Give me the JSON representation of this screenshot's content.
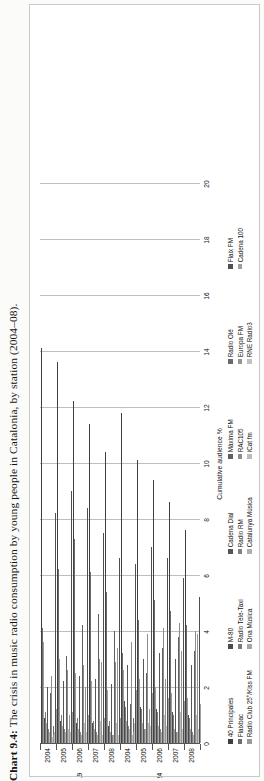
{
  "caption": {
    "number": "Chart 9.4:",
    "text": "The crisis in music radio consumption by young people in Catalonia, by station (2004–08)."
  },
  "chart_data": {
    "type": "bar",
    "orientation": "horizontal",
    "title": "The crisis in music radio consumption by young people in Catalonia, by station (2004–08)",
    "xlabel": "Cumulative audience %",
    "ylabel": "",
    "xlim": [
      0,
      20
    ],
    "xticks": [
      0,
      2,
      4,
      6,
      8,
      10,
      12,
      14,
      16,
      18,
      20
    ],
    "grid": true,
    "legend_position": "bottom",
    "group_labels": [
      "14-19",
      "20-24"
    ],
    "categories": [
      "2004",
      "2005",
      "2006",
      "2007",
      "2008"
    ],
    "series": [
      {
        "name": "40 Principales",
        "color": "#3f3f3f",
        "values_14_19": [
          14.1,
          13.6,
          12.2,
          11.4,
          10.4
        ],
        "values_20_24": [
          11.8,
          10.1,
          9.4,
          8.6,
          7.6
        ]
      },
      {
        "name": "Flaixbac",
        "color": "#6e6e6e",
        "values_14_19": [
          4.1,
          6.2,
          7.3,
          6.1,
          5.4
        ],
        "values_20_24": [
          3.2,
          4.4,
          5.1,
          4.7,
          4.2
        ]
      },
      {
        "name": "Radio Club 25°/Kiss FM",
        "color": "#9b9b9b",
        "values_14_19": [
          3.6,
          3.0,
          2.5,
          2.2,
          1.9
        ],
        "values_20_24": [
          2.6,
          2.3,
          2.0,
          1.8,
          1.6
        ]
      },
      {
        "name": "M-80",
        "color": "#4a4a4a",
        "values_14_19": [
          0.9,
          0.8,
          0.7,
          0.7,
          0.6
        ],
        "values_20_24": [
          1.5,
          1.3,
          1.2,
          1.1,
          1.0
        ]
      },
      {
        "name": "Radio Tele-Taxi",
        "color": "#7a7a7a",
        "values_14_19": [
          1.1,
          1.0,
          0.9,
          0.8,
          0.8
        ],
        "values_20_24": [
          1.3,
          1.2,
          1.1,
          1.0,
          0.9
        ]
      },
      {
        "name": "Ona Música",
        "color": "#a6a6a6",
        "values_14_19": [
          0.7,
          0.6,
          0.5,
          0.5,
          0.4
        ],
        "values_20_24": [
          0.8,
          0.7,
          0.6,
          0.5,
          0.5
        ]
      },
      {
        "name": "Cadena Dial",
        "color": "#555555",
        "values_14_19": [
          2.0,
          2.2,
          2.4,
          2.3,
          2.1
        ],
        "values_20_24": [
          2.8,
          3.0,
          3.2,
          3.0,
          2.8
        ]
      },
      {
        "name": "Radio RM",
        "color": "#828282",
        "values_14_19": [
          0.5,
          0.5,
          0.4,
          0.4,
          0.3
        ],
        "values_20_24": [
          0.6,
          0.5,
          0.5,
          0.4,
          0.4
        ]
      },
      {
        "name": "Catalunya Música",
        "color": "#b0b0b0",
        "values_14_19": [
          0.4,
          0.4,
          0.3,
          0.3,
          0.3
        ],
        "values_20_24": [
          0.5,
          0.5,
          0.4,
          0.4,
          0.3
        ]
      },
      {
        "name": "Màxima FM",
        "color": "#5f5f5f",
        "values_14_19": [
          1.8,
          3.1,
          4.2,
          4.6,
          4.0
        ],
        "values_20_24": [
          1.4,
          2.5,
          3.4,
          3.8,
          3.3
        ]
      },
      {
        "name": "RAC105",
        "color": "#8d8d8d",
        "values_14_19": [
          2.4,
          2.6,
          2.8,
          3.0,
          2.9
        ],
        "values_20_24": [
          3.6,
          3.9,
          4.1,
          4.3,
          4.0
        ]
      },
      {
        "name": "iCat fm",
        "color": "#bcbcbc",
        "values_14_19": [
          0.2,
          0.5,
          0.7,
          0.8,
          0.7
        ],
        "values_20_24": [
          0.3,
          0.7,
          1.0,
          1.1,
          1.0
        ]
      },
      {
        "name": "Radio Olé",
        "color": "#6a6a6a",
        "values_14_19": [
          0.6,
          0.6,
          0.5,
          0.5,
          0.4
        ],
        "values_20_24": [
          0.9,
          0.8,
          0.8,
          0.7,
          0.6
        ]
      },
      {
        "name": "Europa FM",
        "color": "#959595",
        "values_14_19": [
          0.3,
          1.0,
          2.0,
          2.9,
          3.4
        ],
        "values_20_24": [
          0.4,
          1.2,
          2.3,
          3.3,
          3.9
        ]
      },
      {
        "name": "RNE Radio3",
        "color": "#c2c2c2",
        "values_14_19": [
          0.4,
          0.4,
          0.4,
          0.3,
          0.3
        ],
        "values_20_24": [
          0.7,
          0.6,
          0.6,
          0.5,
          0.5
        ]
      },
      {
        "name": "Flaix FM",
        "color": "#4f4f4f",
        "values_14_19": [
          8.2,
          9.0,
          8.4,
          7.5,
          6.6
        ],
        "values_20_24": [
          6.4,
          7.0,
          6.6,
          5.9,
          5.2
        ]
      },
      {
        "name": "Cadena 100",
        "color": "#9f9f9f",
        "values_14_19": [
          1.2,
          1.1,
          1.0,
          0.9,
          0.9
        ],
        "values_20_24": [
          1.9,
          1.8,
          1.6,
          1.5,
          1.4
        ]
      }
    ]
  },
  "legend": {
    "columns": [
      {
        "items": [
          "40 Principales",
          "Flaixbac",
          "Radio Club 25°/Kiss FM"
        ]
      },
      {
        "items": [
          "M-80",
          "Radio Tele-Taxi",
          "Ona Música"
        ]
      },
      {
        "items": [
          "Cadena Dial",
          "Radio RM",
          "Catalunya Música"
        ]
      },
      {
        "items": [
          "Màxima FM",
          "RAC105",
          "iCat fm"
        ]
      },
      {
        "items": [
          "Radio Olé",
          "Europa FM",
          "RNE Radio3"
        ]
      },
      {
        "items": [
          "Flaix FM",
          "Cadena 100"
        ]
      }
    ]
  }
}
